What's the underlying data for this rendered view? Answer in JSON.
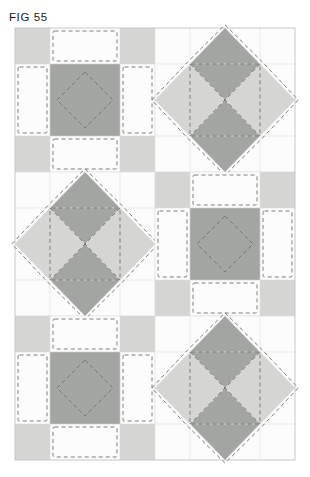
{
  "figure": {
    "label": "FIG 55",
    "caption_position": "top-left"
  },
  "canvas": {
    "width": 310,
    "height": 477,
    "background": "#ffffff"
  },
  "quilt": {
    "title": "Quilt block layout diagram",
    "grid_origin_x": 15,
    "grid_origin_y": 28,
    "block_width": 140,
    "block_height": 144,
    "columns": 2,
    "rows": 3,
    "block_types": [
      [
        "nine-patch-square",
        "eight-point-star"
      ],
      [
        "eight-point-star",
        "nine-patch-square"
      ],
      [
        "nine-patch-square",
        "eight-point-star"
      ]
    ],
    "unit_divisions": 4,
    "seam_line_style": "dashed",
    "seam_line_dash": "4,3",
    "seam_inset_px": 3
  },
  "colors": {
    "background": "#ffffff",
    "fabric_light": "#fbfcfb",
    "fabric_medium": "#d5d6d3",
    "fabric_dark": "#a3a5a2",
    "grid_line": "#d9dad7",
    "seam_dash": "#6e706d",
    "outline": "#b9bab7",
    "label_text": "#1b1b1b"
  },
  "legend": {
    "fabric_light_name": "light fabric",
    "fabric_medium_name": "medium fabric",
    "fabric_dark_name": "dark fabric",
    "dashed_name": "stitching / seam line"
  },
  "blocks": [
    {
      "id": "block-r1c1",
      "type": "nine-patch-square",
      "row": 1,
      "col": 1
    },
    {
      "id": "block-r1c2",
      "type": "eight-point-star",
      "row": 1,
      "col": 2
    },
    {
      "id": "block-r2c1",
      "type": "eight-point-star",
      "row": 2,
      "col": 1
    },
    {
      "id": "block-r2c2",
      "type": "nine-patch-square",
      "row": 2,
      "col": 2
    },
    {
      "id": "block-r3c1",
      "type": "nine-patch-square",
      "row": 3,
      "col": 1
    },
    {
      "id": "block-r3c2",
      "type": "eight-point-star",
      "row": 3,
      "col": 2
    }
  ]
}
